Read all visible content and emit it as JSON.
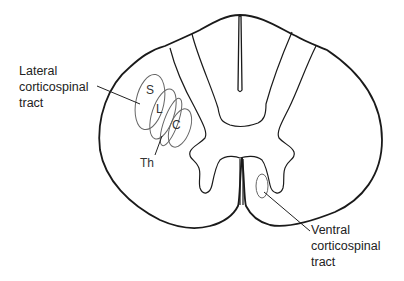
{
  "diagram": {
    "labels": {
      "lateral_tract": [
        "Lateral",
        "corticospinal",
        "tract"
      ],
      "ventral_tract": [
        "Ventral",
        "corticospinal",
        "tract"
      ]
    },
    "lamination": {
      "sacral": "S",
      "lumbar": "L",
      "cervical": "C",
      "thoracic": "Th"
    }
  }
}
